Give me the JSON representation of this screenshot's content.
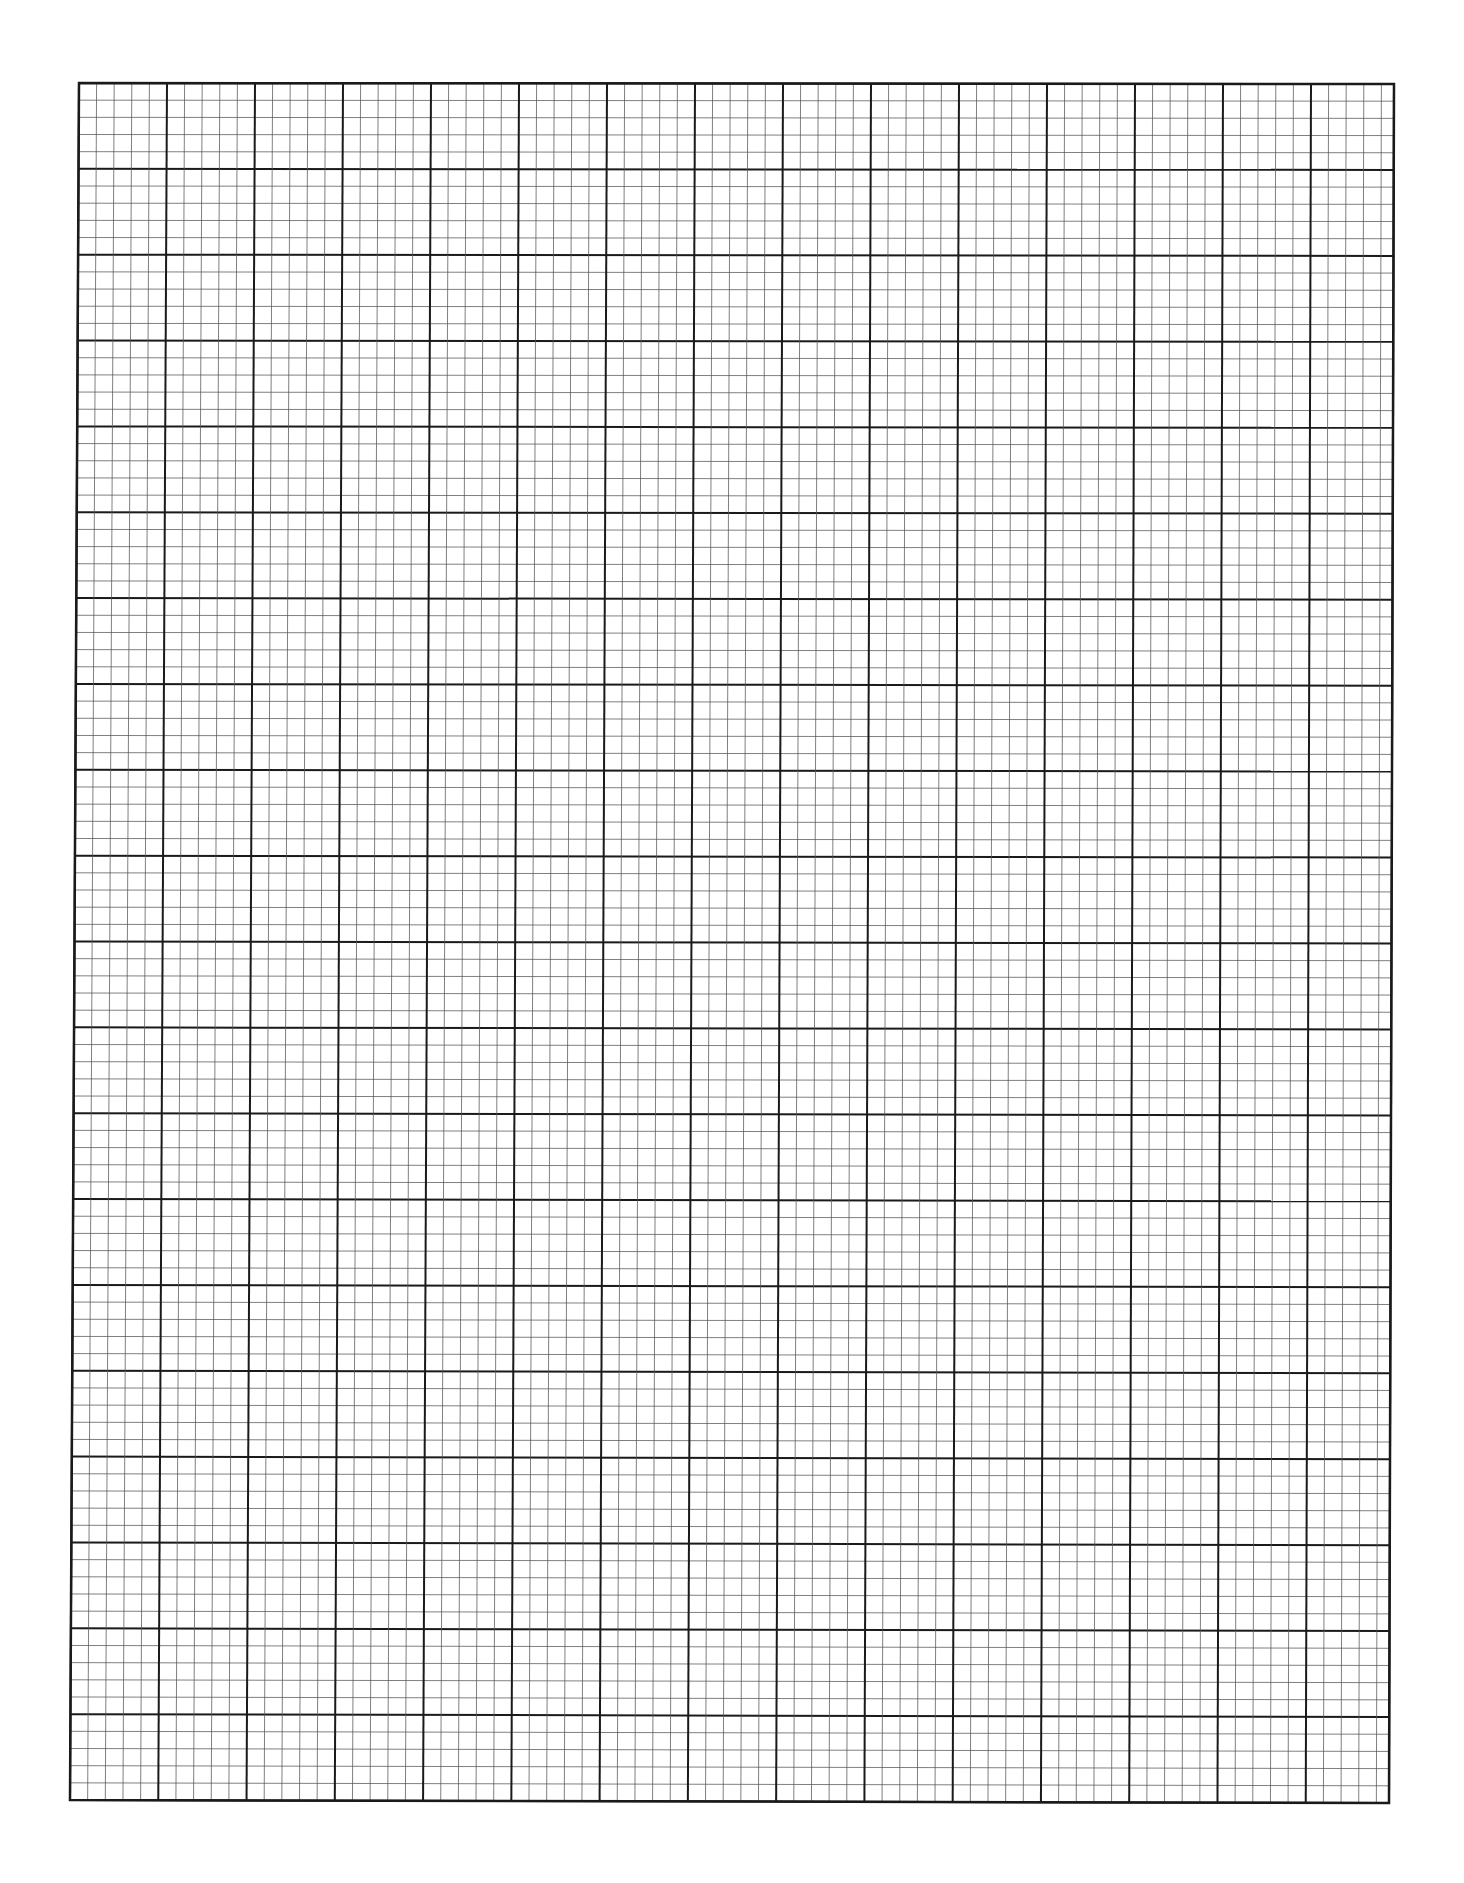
{
  "page": {
    "type": "graph-paper",
    "background_color": "#ffffff"
  },
  "grid": {
    "major_columns": 15,
    "major_rows": 20,
    "minor_per_major": 5,
    "corners": {
      "top_left": [
        79,
        83
      ],
      "top_right": [
        1394,
        84
      ],
      "bottom_left": [
        70,
        1800
      ],
      "bottom_right": [
        1389,
        1803
      ]
    },
    "major_cell_width": 88,
    "major_cell_height": 85.9,
    "major_line_color": "#1a1a1a",
    "minor_line_color": "#555555",
    "major_line_width": 2,
    "minor_line_width": 1
  }
}
